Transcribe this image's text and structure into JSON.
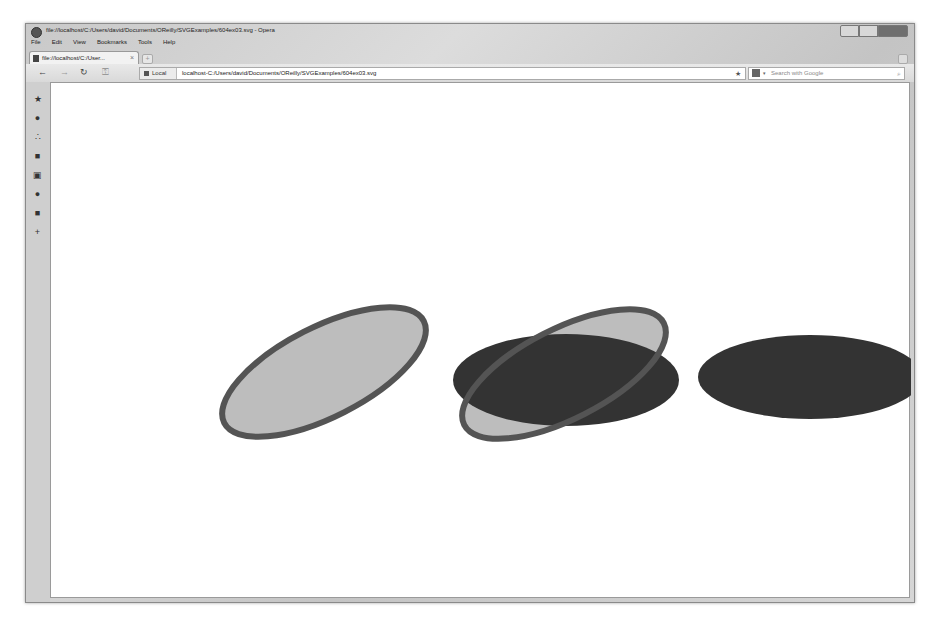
{
  "window": {
    "title": "file://localhost/C:/Users/david/Documents/OReilly/SVGExamples/604ex03.svg - Opera",
    "controls": [
      "minimize",
      "maximize",
      "close"
    ]
  },
  "menubar": {
    "items": [
      "File",
      "Edit",
      "View",
      "Bookmarks",
      "Tools",
      "Help"
    ]
  },
  "tabs": [
    {
      "label": "file://localhost/C:/User...",
      "close": "×"
    }
  ],
  "newtab_label": "+",
  "navbar": {
    "back": "←",
    "forward": "→",
    "reload": "↻",
    "key": "⚿",
    "address_badge": "Local",
    "address": "localhost-C:/Users/david/Documents/OReilly/SVGExamples/604ex03.svg",
    "bookmark_star": "★",
    "search_placeholder": "Search with Google",
    "search_engine_dropdown": "▾",
    "search_go": "⌕"
  },
  "sidebar": {
    "items": [
      {
        "icon": "bookmarks-star-icon",
        "glyph": "★"
      },
      {
        "icon": "speed-dial-icon",
        "glyph": "●"
      },
      {
        "icon": "share-icon",
        "glyph": "∴"
      },
      {
        "icon": "notes-icon",
        "glyph": "■"
      },
      {
        "icon": "transfers-icon",
        "glyph": "▣"
      },
      {
        "icon": "history-icon",
        "glyph": "●"
      },
      {
        "icon": "panels-icon",
        "glyph": "■"
      },
      {
        "icon": "add-panel-icon",
        "glyph": "+"
      }
    ]
  },
  "svg_document": {
    "shapes": [
      {
        "name": "tilted-outlined-ellipse-left",
        "cx": 273,
        "cy": 289,
        "rx": 112,
        "ry": 45,
        "rotate": -27,
        "fill": "#bdbdbd",
        "stroke": "#545454",
        "stroke_width": 6
      },
      {
        "name": "tilted-outlined-ellipse-middle",
        "cx": 513,
        "cy": 291,
        "rx": 112,
        "ry": 45,
        "rotate": -27,
        "fill": "#bdbdbd",
        "stroke": "#545454",
        "stroke_width": 6
      },
      {
        "name": "dark-ellipse-middle",
        "cx": 515,
        "cy": 297,
        "rx": 113,
        "ry": 46,
        "rotate": 0,
        "fill": "#333333"
      },
      {
        "name": "dark-ellipse-right",
        "cx": 759,
        "cy": 294,
        "rx": 112,
        "ry": 42,
        "rotate": 0,
        "fill": "#333333"
      }
    ]
  }
}
